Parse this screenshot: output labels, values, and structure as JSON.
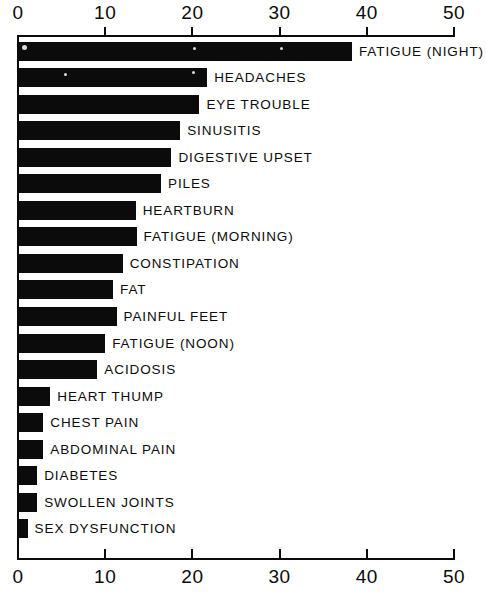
{
  "chart_data": {
    "type": "bar",
    "orientation": "horizontal",
    "title": "",
    "subtitle": "",
    "xlabel": "",
    "ylabel": "",
    "xlim": [
      0,
      50
    ],
    "grid": false,
    "legend": null,
    "axis_positions": [
      "top",
      "bottom"
    ],
    "tick_labels": [
      "0",
      "10",
      "20",
      "30",
      "40",
      "50"
    ],
    "tick_values": [
      0,
      10,
      20,
      30,
      40,
      50
    ],
    "categories": [
      "FATIGUE (NIGHT)",
      "HEADACHES",
      "EYE TROUBLE",
      "SINUSITIS",
      "DIGESTIVE UPSET",
      "PILES",
      "HEARTBURN",
      "FATIGUE (MORNING)",
      "CONSTIPATION",
      "FAT",
      "PAINFUL FEET",
      "FATIGUE (NOON)",
      "ACIDOSIS",
      "HEART THUMP",
      "CHEST PAIN",
      "ABDOMINAL PAIN",
      "DIABETES",
      "SWOLLEN JOINTS",
      "SEX DYSFUNCTION"
    ],
    "values": [
      38.3,
      21.7,
      20.8,
      18.6,
      17.6,
      16.4,
      13.5,
      13.6,
      12.0,
      10.9,
      11.3,
      10.0,
      9.1,
      3.7,
      2.9,
      2.9,
      2.2,
      2.2,
      1.1
    ],
    "bar_color": "#0b0b0b",
    "background_color": "#ffffff"
  }
}
